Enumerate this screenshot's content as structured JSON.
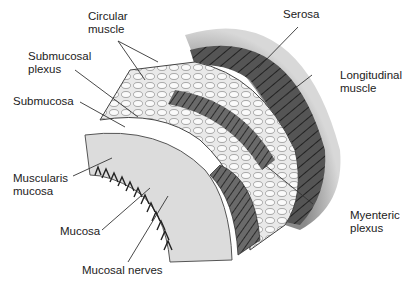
{
  "labels": {
    "circular_muscle": "Circular\nmuscle",
    "serosa": "Serosa",
    "submucosal_plexus": "Submucosal\nplexus",
    "longitudinal_muscle": "Longitudinal\nmuscle",
    "submucosa": "Submucosa",
    "muscularis_mucosa": "Muscularis\nmucosa",
    "mucosa": "Mucosa",
    "myenteric_plexus": "Myenteric\nplexus",
    "mucosal_nerves": "Mucosal nerves"
  },
  "colors": {
    "background": "#ffffff",
    "text": "#222222",
    "leader_line": "#333333",
    "serosa": "#9a9a9a",
    "muscle_dark": "#3a3a3a",
    "tissue_light": "#e6e6e6"
  }
}
